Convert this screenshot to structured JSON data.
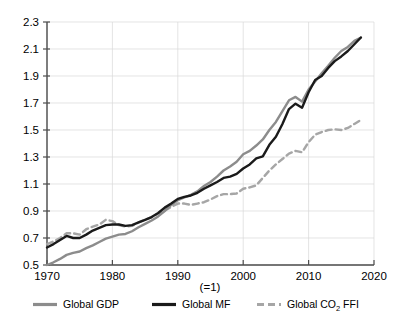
{
  "chart_data": {
    "type": "line",
    "title": "",
    "subtitle": "",
    "xlabel": "",
    "ylabel": "",
    "index_note": "(=1)",
    "xlim": [
      1970,
      2020
    ],
    "ylim": [
      0.5,
      2.3
    ],
    "xticks": [
      "1970",
      "1980",
      "1990",
      "2000",
      "2010",
      "2020"
    ],
    "yticks": [
      "0.5",
      "0.7",
      "0.9",
      "1.1",
      "1.3",
      "1.5",
      "1.7",
      "1.9",
      "2.1",
      "2.3"
    ],
    "grid": true,
    "legend_position": "bottom",
    "x": [
      1970,
      1971,
      1972,
      1973,
      1974,
      1975,
      1976,
      1977,
      1978,
      1979,
      1980,
      1981,
      1982,
      1983,
      1984,
      1985,
      1986,
      1987,
      1988,
      1989,
      1990,
      1991,
      1992,
      1993,
      1994,
      1995,
      1996,
      1997,
      1998,
      1999,
      2000,
      2001,
      2002,
      2003,
      2004,
      2005,
      2006,
      2007,
      2008,
      2009,
      2010,
      2011,
      2012,
      2013,
      2014,
      2015,
      2016,
      2017,
      2018
    ],
    "series": [
      {
        "name": "Global GDP",
        "color": "#8c8c8c",
        "style": "solid",
        "values": [
          0.5,
          0.52,
          0.545,
          0.575,
          0.59,
          0.6,
          0.625,
          0.645,
          0.67,
          0.695,
          0.71,
          0.725,
          0.73,
          0.75,
          0.78,
          0.805,
          0.83,
          0.86,
          0.9,
          0.945,
          0.98,
          1.0,
          1.02,
          1.045,
          1.085,
          1.115,
          1.155,
          1.2,
          1.23,
          1.265,
          1.32,
          1.345,
          1.385,
          1.43,
          1.5,
          1.56,
          1.64,
          1.72,
          1.745,
          1.71,
          1.8,
          1.86,
          1.92,
          1.975,
          2.035,
          2.085,
          2.115,
          2.16,
          2.185
        ],
        "legend_label": "Global GDP"
      },
      {
        "name": "Global MF",
        "color": "#1a1a1a",
        "style": "solid",
        "values": [
          0.63,
          0.655,
          0.685,
          0.715,
          0.7,
          0.7,
          0.725,
          0.755,
          0.775,
          0.795,
          0.8,
          0.8,
          0.79,
          0.795,
          0.815,
          0.835,
          0.855,
          0.885,
          0.925,
          0.955,
          0.99,
          1.005,
          1.015,
          1.035,
          1.065,
          1.09,
          1.115,
          1.145,
          1.155,
          1.175,
          1.215,
          1.245,
          1.29,
          1.305,
          1.39,
          1.45,
          1.545,
          1.655,
          1.695,
          1.665,
          1.78,
          1.87,
          1.9,
          1.96,
          2.01,
          2.045,
          2.085,
          2.135,
          2.185
        ],
        "legend_label": "Global MF"
      },
      {
        "name": "Global CO2 FFI",
        "color": "#a6a6a6",
        "style": "dashed",
        "values": [
          0.655,
          0.675,
          0.7,
          0.735,
          0.735,
          0.725,
          0.765,
          0.785,
          0.8,
          0.835,
          0.825,
          0.795,
          0.785,
          0.79,
          0.815,
          0.835,
          0.855,
          0.88,
          0.905,
          0.93,
          0.955,
          0.955,
          0.945,
          0.955,
          0.965,
          0.985,
          1.01,
          1.025,
          1.025,
          1.03,
          1.065,
          1.075,
          1.09,
          1.145,
          1.2,
          1.245,
          1.285,
          1.325,
          1.345,
          1.335,
          1.41,
          1.465,
          1.485,
          1.5,
          1.505,
          1.5,
          1.515,
          1.545,
          1.575
        ],
        "legend_label": "Global CO₂ FFI"
      }
    ]
  },
  "axis": {
    "x_labels": [
      "1970",
      "1980",
      "1990",
      "2000",
      "2010",
      "2020"
    ],
    "y_labels": [
      "2.3",
      "2.1",
      "1.9",
      "1.7",
      "1.5",
      "1.3",
      "1.1",
      "0.9",
      "0.7",
      "0.5"
    ],
    "index_note": "(=1)"
  },
  "legend": {
    "items": [
      {
        "label": "Global GDP",
        "sub": "",
        "tail": "",
        "color": "#8c8c8c",
        "style": "solid"
      },
      {
        "label": "Global MF",
        "sub": "",
        "tail": "",
        "color": "#1a1a1a",
        "style": "solid"
      },
      {
        "label": "Global CO",
        "sub": "2",
        "tail": " FFI",
        "color": "#a6a6a6",
        "style": "dashed"
      }
    ]
  }
}
